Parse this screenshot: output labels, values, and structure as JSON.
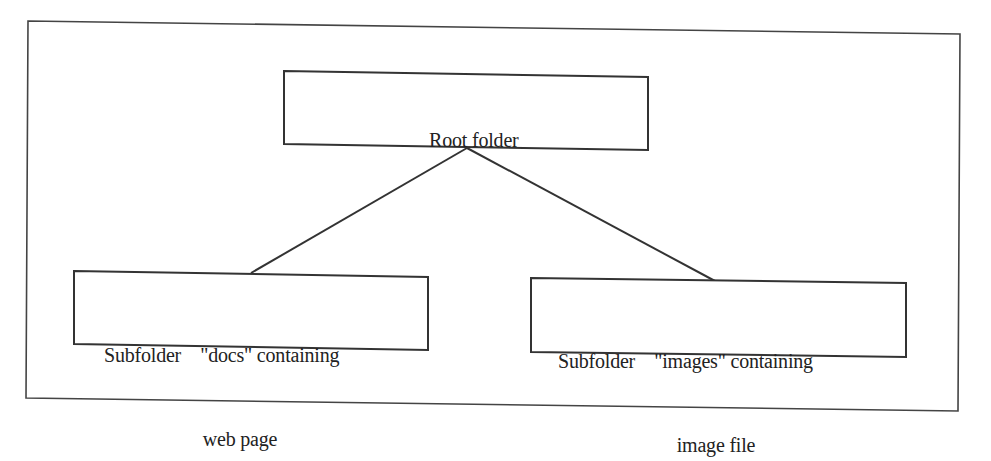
{
  "diagram": {
    "type": "tree",
    "title": "",
    "colors": {
      "stroke": "#333333",
      "background": "#ffffff",
      "text": "#222222"
    },
    "nodes": [
      {
        "id": "root",
        "label": "Root folder",
        "lines": [
          "Root folder"
        ]
      },
      {
        "id": "docs",
        "label": "Subfolder \"docs\" containing web page",
        "lines": [
          "Subfolder    \"docs\" containing",
          "web page"
        ]
      },
      {
        "id": "images",
        "label": "Subfolder \"images\" containing image file",
        "lines": [
          "Subfolder    \"images\" containing",
          "image file"
        ]
      }
    ],
    "edges": [
      {
        "from": "root",
        "to": "docs"
      },
      {
        "from": "root",
        "to": "images"
      }
    ]
  }
}
